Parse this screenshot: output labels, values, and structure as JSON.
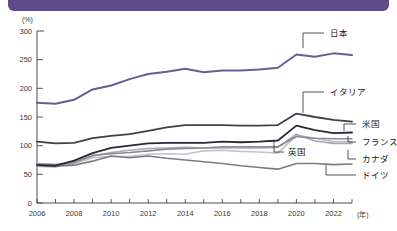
{
  "header": {
    "accent_color": "#5e4b87"
  },
  "axes": {
    "y_unit": "(%)",
    "x_unit": "(年)",
    "y_ticks": [
      "0",
      "50",
      "100",
      "150",
      "200",
      "250",
      "300"
    ],
    "x_ticks": [
      "2006",
      "2008",
      "2010",
      "2012",
      "2014",
      "2016",
      "2018",
      "2020",
      "2022"
    ]
  },
  "annotations": {
    "japan": "日本",
    "italy": "イタリア",
    "usa": "米国",
    "france": "フランス",
    "uk": "英国",
    "canada": "カナダ",
    "germany": "ドイツ"
  },
  "chart_data": {
    "type": "line",
    "title": "",
    "xlabel": "(年)",
    "ylabel": "(%)",
    "ylim": [
      0,
      300
    ],
    "xlim": [
      2006,
      2023
    ],
    "grid": false,
    "legend_position": "inline-right-labels",
    "x": [
      2006,
      2007,
      2008,
      2009,
      2010,
      2011,
      2012,
      2013,
      2014,
      2015,
      2016,
      2017,
      2018,
      2019,
      2020,
      2021,
      2022,
      2023
    ],
    "series": [
      {
        "name": "日本",
        "color": "#6b5b9a",
        "width": 2.0,
        "values": [
          175,
          173,
          180,
          198,
          205,
          216,
          225,
          229,
          234,
          228,
          231,
          231,
          233,
          236,
          259,
          255,
          261,
          258
        ]
      },
      {
        "name": "イタリア",
        "color": "#3f3f48",
        "width": 1.8,
        "values": [
          107,
          104,
          105,
          113,
          117,
          120,
          126,
          132,
          136,
          136,
          136,
          135,
          135,
          136,
          156,
          150,
          145,
          142
        ]
      },
      {
        "name": "米国",
        "color": "#2e2636",
        "width": 1.8,
        "values": [
          66,
          65,
          74,
          87,
          96,
          100,
          104,
          105,
          105,
          105,
          107,
          106,
          107,
          109,
          135,
          127,
          122,
          123
        ]
      },
      {
        "name": "フランス",
        "color": "#8a8a92",
        "width": 1.6,
        "values": [
          68,
          67,
          71,
          83,
          86,
          88,
          91,
          94,
          95,
          96,
          98,
          98,
          98,
          98,
          116,
          113,
          112,
          112
        ]
      },
      {
        "name": "英国",
        "color": "#a9a9b0",
        "width": 1.6,
        "values": [
          64,
          63,
          70,
          82,
          88,
          92,
          95,
          96,
          97,
          96,
          96,
          96,
          96,
          97,
          120,
          108,
          104,
          104
        ]
      },
      {
        "name": "カナダ",
        "color": "#c2c2c8",
        "width": 1.6,
        "values": [
          69,
          67,
          68,
          79,
          81,
          81,
          85,
          86,
          85,
          91,
          92,
          90,
          89,
          87,
          118,
          113,
          107,
          107
        ]
      },
      {
        "name": "ドイツ",
        "color": "#7b7b84",
        "width": 1.6,
        "values": [
          67,
          64,
          66,
          73,
          82,
          79,
          82,
          78,
          75,
          72,
          69,
          65,
          62,
          59,
          69,
          69,
          67,
          68
        ]
      }
    ]
  }
}
